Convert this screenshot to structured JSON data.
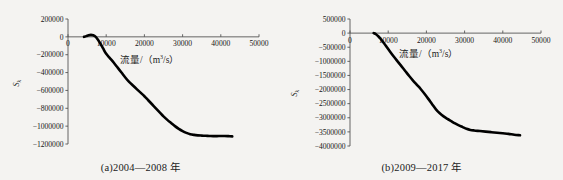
{
  "figure": {
    "background_color": "#f4f3f1",
    "curve_color": "#000000",
    "axis_color": "#555555"
  },
  "panels": [
    {
      "id": "panel-a",
      "caption": "(a)2004—2008 年",
      "ylabel": "S",
      "ylabel_sub": "k",
      "xlabel_prefix": "流量/（m",
      "xlabel_sup": "3",
      "xlabel_suffix": "/s）",
      "chart_data": {
        "type": "line",
        "title": "(a)2004—2008 年",
        "xlabel": "流量/（m3/s）",
        "ylabel": "Sk",
        "xlim": [
          0,
          50000
        ],
        "ylim": [
          -1200000,
          200000
        ],
        "xticks": [
          0,
          10000,
          20000,
          30000,
          40000,
          50000
        ],
        "xtick_labels": [
          "0",
          "10000",
          "20000",
          "30000",
          "40000",
          "50000"
        ],
        "yticks": [
          200000,
          0,
          -200000,
          -400000,
          -600000,
          -800000,
          -1000000,
          -1200000
        ],
        "ytick_labels": [
          "200000",
          "0",
          "-200000",
          "-400000",
          "-600000",
          "-800000",
          "-1000000",
          "-1200000"
        ],
        "grid": false,
        "legend": "none",
        "series": [
          {
            "name": "Sk",
            "x": [
              4200,
              4800,
              5400,
              6000,
              6600,
              7200,
              7800,
              8400,
              9200,
              10000,
              11000,
              12000,
              13000,
              14000,
              15000,
              16000,
              17000,
              18000,
              19000,
              20000,
              21000,
              22000,
              23000,
              24000,
              25000,
              26000,
              27000,
              28000,
              29000,
              30000,
              31000,
              32000,
              33000,
              34000,
              35000,
              36000,
              37000,
              38000,
              39000,
              40000,
              41000,
              42000,
              43000
            ],
            "y": [
              0,
              8000,
              18000,
              22000,
              18000,
              2000,
              -30000,
              -70000,
              -130000,
              -190000,
              -240000,
              -290000,
              -345000,
              -400000,
              -455000,
              -505000,
              -545000,
              -585000,
              -625000,
              -665000,
              -710000,
              -755000,
              -800000,
              -845000,
              -890000,
              -930000,
              -965000,
              -1000000,
              -1030000,
              -1055000,
              -1075000,
              -1090000,
              -1098000,
              -1103000,
              -1106000,
              -1108000,
              -1110000,
              -1112000,
              -1112000,
              -1110000,
              -1110000,
              -1112000,
              -1115000
            ]
          }
        ]
      }
    },
    {
      "id": "panel-b",
      "caption": "(b)2009—2017 年",
      "ylabel": "S",
      "ylabel_sub": "k",
      "xlabel_prefix": "流量/（m",
      "xlabel_sup": "3",
      "xlabel_suffix": "/s）",
      "chart_data": {
        "type": "line",
        "title": "(b)2009—2017 年",
        "xlabel": "流量/（m3/s）",
        "ylabel": "Sk",
        "xlim": [
          0,
          50000
        ],
        "ylim": [
          -4000000,
          500000
        ],
        "xticks": [
          0,
          10000,
          20000,
          30000,
          40000,
          50000
        ],
        "xtick_labels": [
          "0",
          "10000",
          "20000",
          "30000",
          "40000",
          "50000"
        ],
        "yticks": [
          500000,
          0,
          -500000,
          -1000000,
          -1500000,
          -2000000,
          -2500000,
          -3000000,
          -3500000,
          -4000000
        ],
        "ytick_labels": [
          "500000",
          "0",
          "-500000",
          "-1000000",
          "-1500000",
          "-2000000",
          "-2500000",
          "-3000000",
          "-3500000",
          "-4000000"
        ],
        "grid": false,
        "legend": "none",
        "series": [
          {
            "name": "Sk",
            "x": [
              6200,
              6800,
              7400,
              8000,
              8800,
              9600,
              10500,
              11500,
              12500,
              13500,
              14500,
              15500,
              16500,
              17500,
              18500,
              19500,
              20500,
              21500,
              22500,
              23500,
              24500,
              25500,
              26500,
              27500,
              28500,
              29500,
              30500,
              31500,
              32500,
              34000,
              35500,
              37000,
              38500,
              40000,
              41500,
              43000,
              44500
            ],
            "y": [
              0,
              -40000,
              -110000,
              -200000,
              -340000,
              -490000,
              -660000,
              -840000,
              -1010000,
              -1180000,
              -1350000,
              -1520000,
              -1680000,
              -1830000,
              -1980000,
              -2150000,
              -2330000,
              -2520000,
              -2700000,
              -2840000,
              -2950000,
              -3040000,
              -3120000,
              -3200000,
              -3270000,
              -3330000,
              -3390000,
              -3430000,
              -3450000,
              -3470000,
              -3490000,
              -3510000,
              -3530000,
              -3550000,
              -3570000,
              -3600000,
              -3620000
            ]
          }
        ]
      }
    }
  ]
}
